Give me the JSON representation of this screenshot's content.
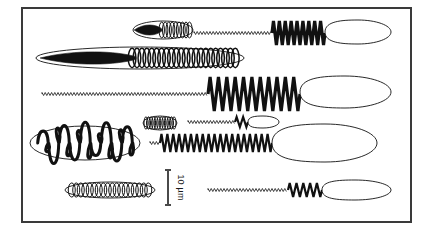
{
  "figure": {
    "background_color": "#ffffff",
    "ink_color": "#111111",
    "frame": {
      "name": "figure-border",
      "color": "#3a3a3a",
      "x": 22,
      "y": 8,
      "width": 389,
      "height": 214,
      "stroke_width": 2
    }
  },
  "scale_bar": {
    "label": "10 µm",
    "orientation": "vertical",
    "text_rotation_deg": 90,
    "x": 168,
    "y_top": 170,
    "y_bottom": 205,
    "length_px": 35,
    "color": "#4a4a4a"
  },
  "rows": [
    {
      "id": "row-1",
      "cyst": {
        "name": "cyst-lens-coiled",
        "label": "Lens-shaped cyst with internal coil",
        "cx": 163,
        "cy": 30,
        "rx": 30,
        "ry": 9,
        "coils": 9,
        "solid_taper": true
      },
      "spirochete": {
        "name": "spirochete-short-dense",
        "label": "Short spirochete, dense amplitude waves with terminal vesicle",
        "filament_x_start": 194,
        "filament_x_end": 272,
        "wave_x_start": 272,
        "wave_x_end": 325,
        "wave_count": 9,
        "wave_amplitude": 12,
        "baseline_y": 33,
        "vesicle": {
          "cx": 358,
          "cy": 32,
          "rx": 33,
          "ry": 12
        }
      }
    },
    {
      "id": "row-2",
      "cyst": {
        "name": "cyst-elongate-helix",
        "label": "Elongate cyst enclosing an open helix",
        "cx": 140,
        "cy": 58,
        "rx": 104,
        "ry": 11,
        "coils": 22,
        "solid_taper": true
      },
      "spirochete": null
    },
    {
      "id": "row-3",
      "cyst": null,
      "spirochete": {
        "name": "spirochete-long-large-amplitude",
        "label": "Long spirochete, thin proximal filament and large-amplitude distal waves",
        "filament_x_start": 42,
        "filament_x_end": 208,
        "wave_x_start": 208,
        "wave_x_end": 300,
        "wave_count": 11,
        "wave_amplitude": 17,
        "baseline_y": 94,
        "vesicle": {
          "cx": 345,
          "cy": 92,
          "rx": 46,
          "ry": 16
        }
      }
    },
    {
      "id": "row-4a",
      "cyst": {
        "name": "cyst-small-dense",
        "label": "Small dense cyst",
        "cx": 160,
        "cy": 123,
        "rx": 17,
        "ry": 7,
        "coils": 12,
        "solid_taper": false
      },
      "spirochete": {
        "name": "spirochete-thin-small-vesicle",
        "label": "Thin spirochete with small terminal vesicle",
        "filament_x_start": 188,
        "filament_x_end": 235,
        "wave_x_start": 235,
        "wave_x_end": 248,
        "wave_count": 2,
        "wave_amplitude": 5,
        "baseline_y": 122,
        "vesicle": {
          "cx": 263,
          "cy": 122,
          "rx": 16,
          "ry": 6
        }
      }
    },
    {
      "id": "row-4b",
      "cyst": {
        "name": "cyst-tangled-coil",
        "label": "Cyst containing an irregular tangled coil",
        "cx": 85,
        "cy": 143,
        "rx": 55,
        "ry": 17,
        "coils": 9,
        "solid_taper": false,
        "tangled": true
      },
      "spirochete": {
        "name": "spirochete-regular-zigzag",
        "label": "Spirochete with regular zigzag waves and large terminal vesicle",
        "filament_x_start": 150,
        "filament_x_end": 160,
        "wave_x_start": 160,
        "wave_x_end": 272,
        "wave_count": 19,
        "wave_amplitude": 9,
        "baseline_y": 143,
        "vesicle": {
          "cx": 325,
          "cy": 143,
          "rx": 52,
          "ry": 19
        }
      }
    },
    {
      "id": "row-5",
      "cyst": {
        "name": "cyst-slender-coiled",
        "label": "Slender cyst with fine internal coils",
        "cx": 110,
        "cy": 190,
        "rx": 45,
        "ry": 8,
        "coils": 18,
        "solid_taper": false
      },
      "spirochete": {
        "name": "spirochete-short-terminal-wave",
        "label": "Spirochete with long thin filament and short terminal wave",
        "filament_x_start": 208,
        "filament_x_end": 288,
        "wave_x_start": 288,
        "wave_x_end": 322,
        "wave_count": 5,
        "wave_amplitude": 7,
        "baseline_y": 190,
        "vesicle": {
          "cx": 355,
          "cy": 190,
          "rx": 36,
          "ry": 10
        }
      }
    }
  ]
}
